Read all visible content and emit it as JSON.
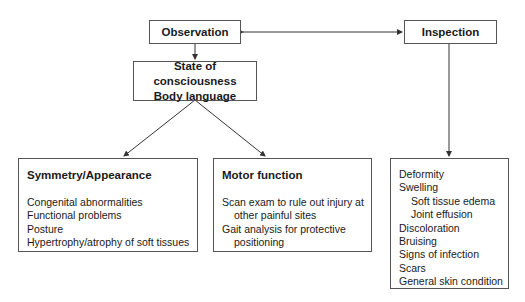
{
  "diagram": {
    "nodes": {
      "observation": {
        "label": "Observation"
      },
      "inspection": {
        "label": "Inspection"
      },
      "state": {
        "lines": [
          "State of consciousness",
          "Body language"
        ]
      },
      "symmetry": {
        "title": "Symmetry/Appearance",
        "items": [
          "Congenital abnormalities",
          "Functional problems",
          "Posture",
          "Hypertrophy/atrophy of soft tissues"
        ]
      },
      "motor": {
        "title": "Motor function",
        "items": [
          "Scan exam to rule out injury at",
          "other painful sites",
          "Gait analysis for protective",
          "positioning"
        ]
      },
      "inspection_list": {
        "items": [
          "Deformity",
          "Swelling",
          "Soft tissue edema",
          "Joint effusion",
          "Discoloration",
          "Bruising",
          "Signs of infection",
          "Scars",
          "General skin condition"
        ]
      }
    },
    "edges": [
      {
        "from": "observation",
        "to": "inspection",
        "type": "bidirectional"
      },
      {
        "from": "observation",
        "to": "state",
        "type": "arrow"
      },
      {
        "from": "state",
        "to": "symmetry",
        "type": "arrow"
      },
      {
        "from": "state",
        "to": "motor",
        "type": "arrow"
      },
      {
        "from": "inspection",
        "to": "inspection_list",
        "type": "arrow"
      }
    ],
    "colors": {
      "line": "#333333",
      "border": "#555555",
      "text": "#1a1a1a"
    }
  }
}
